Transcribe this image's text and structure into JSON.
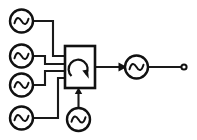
{
  "diagram": {
    "title": "Multi-source signal combiner schematic",
    "background_color": "#ffffff",
    "line_color": "#111111",
    "width": 197,
    "height": 140,
    "sources": [
      {
        "id": "source-1",
        "label": "",
        "symbol": "sine-source",
        "cx": 21.5,
        "cy": 21.0,
        "r": 11.5,
        "port_y": 21.0
      },
      {
        "id": "source-2",
        "label": "",
        "symbol": "sine-source",
        "cx": 21.5,
        "cy": 56.0,
        "r": 11.5,
        "port_y": 56.0
      },
      {
        "id": "source-3",
        "label": "",
        "symbol": "sine-source",
        "cx": 21.5,
        "cy": 85.0,
        "r": 11.5,
        "port_y": 85.0
      },
      {
        "id": "source-4",
        "label": "",
        "symbol": "sine-source",
        "cx": 21.5,
        "cy": 118.0,
        "r": 11.5,
        "port_y": 118.0
      }
    ],
    "bottom_source": {
      "id": "source-5",
      "label": "",
      "symbol": "sine-source",
      "cx": 78.5,
      "cy": 119.5,
      "r": 11.5
    },
    "mixer": {
      "id": "mixer-box",
      "label": "",
      "symbol": "circular-loop-arrow",
      "x": 65,
      "y": 46,
      "width": 30,
      "height": 42,
      "input_ports_y": [
        56,
        64,
        71,
        78
      ],
      "bottom_port_x": 78.5,
      "output_port_y": 67
    },
    "output_device": {
      "id": "output-oscillator",
      "label": "",
      "symbol": "sine-source",
      "cx": 136.5,
      "cy": 67.0,
      "r": 11.5
    },
    "terminal": {
      "id": "output-terminal",
      "label": "",
      "symbol": "open-circle-terminal",
      "cx": 184.0,
      "cy": 67.0,
      "r": 2.6
    },
    "wires": [
      {
        "id": "wire-source-1",
        "path": "M 33 21 L 53 21 L 53 56 L 65 56"
      },
      {
        "id": "wire-source-2",
        "path": "M 33 56 L 45 56 L 45 64 L 65 64"
      },
      {
        "id": "wire-source-3",
        "path": "M 33 85 L 45 85 L 45 71 L 65 71"
      },
      {
        "id": "wire-source-4",
        "path": "M 33 118 L 58 118 L 58 78 L 65 78"
      },
      {
        "id": "wire-bottom-source",
        "path": "M 78.5 108 L 78.5 90"
      },
      {
        "id": "wire-mixer-output",
        "path": "M 95 67 L 125 67"
      },
      {
        "id": "wire-output-terminal",
        "path": "M 148 67 L 182 67"
      }
    ],
    "arrows": [
      {
        "id": "arrow-into-mixer-bottom",
        "direction": "up",
        "x": 78.5,
        "y": 89
      },
      {
        "id": "arrow-into-output-oscillator",
        "direction": "right",
        "x": 126,
        "y": 67
      },
      {
        "id": "arrow-mixer-loop",
        "direction": "down-right",
        "x": 85,
        "y": 77
      }
    ]
  }
}
